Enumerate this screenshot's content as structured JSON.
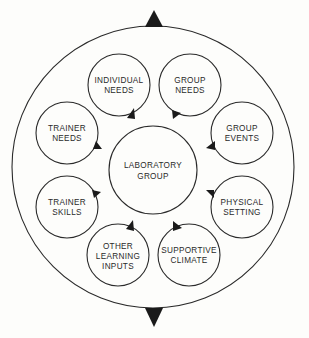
{
  "diagram": {
    "type": "concentric-cycle",
    "outer_circle": {
      "cx": 153,
      "cy": 167,
      "r": 141
    },
    "top_arrow": {
      "direction": "up"
    },
    "bottom_arrow": {
      "direction": "down"
    },
    "center": {
      "line1": "LABORATORY",
      "line2": "GROUP"
    },
    "nodes": [
      {
        "id": "individual-needs",
        "lines": [
          "INDIVIDUAL",
          "NEEDS"
        ]
      },
      {
        "id": "group-needs",
        "lines": [
          "GROUP",
          "NEEDS"
        ]
      },
      {
        "id": "group-events",
        "lines": [
          "GROUP",
          "EVENTS"
        ]
      },
      {
        "id": "physical-setting",
        "lines": [
          "PHYSICAL",
          "SETTING"
        ]
      },
      {
        "id": "supportive-climate",
        "lines": [
          "SUPPORTIVE",
          "CLIMATE"
        ]
      },
      {
        "id": "other-learning-inputs",
        "lines": [
          "OTHER",
          "LEARNING",
          "INPUTS"
        ]
      },
      {
        "id": "trainer-skills",
        "lines": [
          "TRAINER",
          "SKILLS"
        ]
      },
      {
        "id": "trainer-needs",
        "lines": [
          "TRAINER",
          "NEEDS"
        ]
      }
    ],
    "colors": {
      "stroke": "#2a2a2a",
      "arrow": "#1a1a1a",
      "background": "#fdfdfb"
    }
  }
}
